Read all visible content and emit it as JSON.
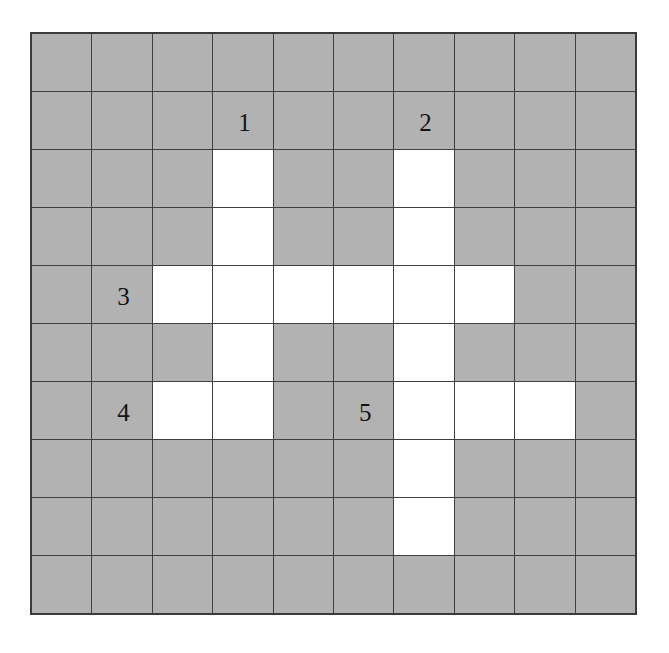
{
  "figure": {
    "kind": "crossword-grid",
    "rows": 10,
    "columns": 10,
    "colors": {
      "blocked_cell": "#b2b2b2",
      "open_cell": "#ffffff",
      "grid_line": "#3f3f3f",
      "outer_border": "#3a3a3a",
      "number_text": "#141414",
      "page_background": "#ffffff"
    }
  },
  "grid": {
    "legend": {
      "blocked": "blocked",
      "open": "open"
    },
    "cells": [
      [
        "blocked",
        "blocked",
        "blocked",
        "blocked",
        "blocked",
        "blocked",
        "blocked",
        "blocked",
        "blocked",
        "blocked"
      ],
      [
        "blocked",
        "blocked",
        "blocked",
        "blocked",
        "blocked",
        "blocked",
        "blocked",
        "blocked",
        "blocked",
        "blocked"
      ],
      [
        "blocked",
        "blocked",
        "blocked",
        "open",
        "blocked",
        "blocked",
        "open",
        "blocked",
        "blocked",
        "blocked"
      ],
      [
        "blocked",
        "blocked",
        "blocked",
        "open",
        "blocked",
        "blocked",
        "open",
        "blocked",
        "blocked",
        "blocked"
      ],
      [
        "blocked",
        "blocked",
        "open",
        "open",
        "open",
        "open",
        "open",
        "open",
        "blocked",
        "blocked"
      ],
      [
        "blocked",
        "blocked",
        "blocked",
        "open",
        "blocked",
        "blocked",
        "open",
        "blocked",
        "blocked",
        "blocked"
      ],
      [
        "blocked",
        "blocked",
        "open",
        "open",
        "blocked",
        "blocked",
        "open",
        "open",
        "open",
        "blocked"
      ],
      [
        "blocked",
        "blocked",
        "blocked",
        "blocked",
        "blocked",
        "blocked",
        "open",
        "blocked",
        "blocked",
        "blocked"
      ],
      [
        "blocked",
        "blocked",
        "blocked",
        "blocked",
        "blocked",
        "blocked",
        "open",
        "blocked",
        "blocked",
        "blocked"
      ],
      [
        "blocked",
        "blocked",
        "blocked",
        "blocked",
        "blocked",
        "blocked",
        "blocked",
        "blocked",
        "blocked",
        "blocked"
      ]
    ],
    "numbers": [
      {
        "label": "1",
        "row": 1,
        "col": 3
      },
      {
        "label": "2",
        "row": 1,
        "col": 6
      },
      {
        "label": "3",
        "row": 4,
        "col": 1
      },
      {
        "label": "4",
        "row": 6,
        "col": 1
      },
      {
        "label": "5",
        "row": 6,
        "col": 5
      }
    ]
  }
}
